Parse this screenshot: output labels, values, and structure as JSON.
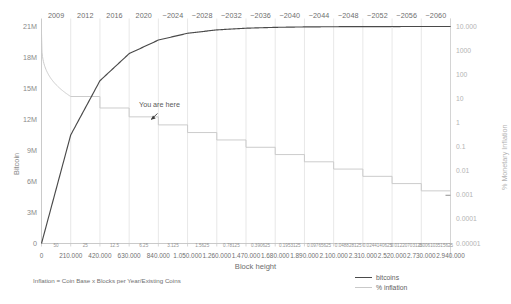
{
  "chart_data": {
    "type": "line",
    "title": "",
    "xlabel": "Block height",
    "ylabel": "Bitcoin",
    "y2label": "% Monetary Inflation",
    "grid": true,
    "legend_position": "bottom-right",
    "note": "Inflation = Coin Base x Blocks per Year/Existing Coins",
    "annotation": "You are here",
    "ylim": [
      0,
      21000000
    ],
    "yticks": [
      "0",
      "3M",
      "6M",
      "9M",
      "12M",
      "15M",
      "18M",
      "21M"
    ],
    "y2lim": [
      1e-05,
      10000
    ],
    "y2ticks": [
      "10.000",
      "1000",
      "100",
      "10",
      "1",
      "0.1",
      "0.01",
      "0.001",
      "0.0001",
      "0.00001"
    ],
    "year_ticks": [
      "2009",
      "2012",
      "2016",
      "2020",
      "~2024",
      "~2028",
      "~2032",
      "~2036",
      "~2040",
      "~2044",
      "~2048",
      "~2052",
      "~2056",
      "~2060"
    ],
    "block_height_ticks": [
      "0",
      "210.000",
      "420.000",
      "630.000",
      "840.000",
      "1.050.000",
      "1.260.000",
      "1.470.000",
      "1.680.000",
      "1.890.000",
      "2.100.000",
      "2.310.000",
      "2.520.000",
      "2.730.000",
      "2.940.000"
    ],
    "coin_base_ticks": [
      "50",
      "25",
      "12.5",
      "6.25",
      "3.125",
      "1.5625",
      "0.78125",
      "0.390625",
      "0.1953125",
      "0.09765625",
      "0.048828125",
      "0.0244140625",
      "0.01220703125",
      "0.006103515625"
    ],
    "series": [
      {
        "name": "bitcoins",
        "color": "#4a4a4a",
        "x": [
          0,
          210000,
          420000,
          630000,
          840000,
          1050000,
          1260000,
          1470000,
          1680000,
          1890000,
          2100000,
          2310000,
          2520000,
          2730000,
          2940000
        ],
        "values": [
          0,
          10500000,
          15750000,
          18375000,
          19687500,
          20343750,
          20671875,
          20835937,
          20917968,
          20958984,
          20979492,
          20989746,
          20994873,
          20997436,
          20998718
        ]
      },
      {
        "name": "% inflation",
        "color": "#c9c9c9",
        "x": [
          0,
          210000,
          420000,
          630000,
          840000,
          1050000,
          1260000,
          1470000,
          1680000,
          1890000,
          2100000,
          2310000,
          2520000,
          2730000,
          2940000
        ],
        "values": [
          5000,
          12.5,
          4.17,
          1.79,
          0.83,
          0.4,
          0.197,
          0.0979,
          0.0489,
          0.02443,
          0.012212,
          0.0061053,
          0.0030525,
          0.0015262,
          0.0007631
        ]
      }
    ]
  },
  "legend": {
    "items": [
      {
        "label": "bitcoins",
        "style": "solid-dark"
      },
      {
        "label": "% inflation",
        "style": "solid-light"
      }
    ]
  }
}
